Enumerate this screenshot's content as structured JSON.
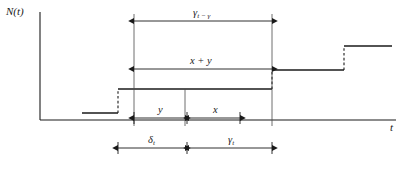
{
  "figure": {
    "background_color": "#ffffff",
    "line_color": "#1a1a1a",
    "width": 409,
    "height": 169
  },
  "axes": {
    "y_label": "N(t)",
    "x_label": "t",
    "y_axis": {
      "x": 40,
      "top": 12,
      "bottom": 120
    },
    "x_axis": {
      "y": 120,
      "left": 40,
      "right": 396
    }
  },
  "step_function": {
    "description": "Non-decreasing right-continuous counting step function N(t)",
    "segments": [
      {
        "x1": 82,
        "x2": 118,
        "y": 113
      },
      {
        "x1": 118,
        "x2": 272,
        "y": 89
      },
      {
        "x1": 272,
        "x2": 344,
        "y": 70
      },
      {
        "x1": 344,
        "x2": 392,
        "y": 46
      }
    ],
    "risers": [
      {
        "x": 118,
        "y1": 113,
        "y2": 89,
        "style": "dashed"
      },
      {
        "x": 272,
        "y1": 89,
        "y2": 70,
        "style": "dashed"
      },
      {
        "x": 344,
        "y1": 70,
        "y2": 46,
        "style": "dashed"
      }
    ]
  },
  "guide_lines": [
    {
      "name": "left-renewal-guide",
      "x": 134,
      "y1": 14,
      "y2": 126
    },
    {
      "name": "current-time-guide",
      "x": 185,
      "y1": 89,
      "y2": 126
    },
    {
      "name": "right-renewal-guide",
      "x": 272,
      "y1": 14,
      "y2": 126
    }
  ],
  "dimensions": [
    {
      "name": "total-life-top",
      "label_main": "γ",
      "label_sub": "t − γ",
      "label_text": "γt−γ",
      "x1": 134,
      "x2": 272,
      "y": 21,
      "label_x": 203,
      "label_y": 13
    },
    {
      "name": "total-life-xy",
      "label_main": "x + y",
      "label_sub": "",
      "label_text": "x + y",
      "x1": 134,
      "x2": 272,
      "y": 69,
      "label_x": 203,
      "label_y": 61
    },
    {
      "name": "age-y",
      "label_main": "y",
      "label_sub": "",
      "label_text": "y",
      "x1": 134,
      "x2": 185,
      "y": 118,
      "label_x": 159,
      "label_y": 110
    },
    {
      "name": "residual-x",
      "label_main": "x",
      "label_sub": "",
      "label_text": "x",
      "x1": 189,
      "x2": 240,
      "y": 118,
      "label_x": 214,
      "label_y": 110
    },
    {
      "name": "age-delta-t",
      "label_main": "δ",
      "label_sub": "t",
      "label_text": "δt",
      "x1": 118,
      "x2": 185,
      "y": 148,
      "label_x": 151,
      "label_y": 139
    },
    {
      "name": "residual-gamma-t",
      "label_main": "γ",
      "label_sub": "t",
      "label_text": "γt",
      "x1": 189,
      "x2": 272,
      "y": 148,
      "label_x": 230,
      "label_y": 139
    }
  ]
}
